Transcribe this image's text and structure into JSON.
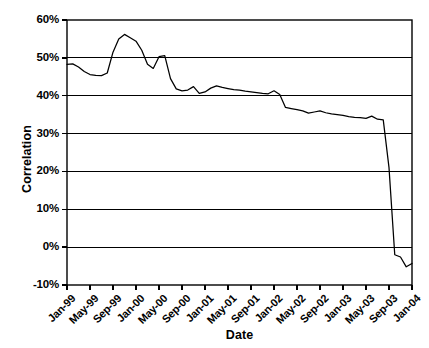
{
  "chart_data": {
    "type": "line",
    "title": "",
    "xlabel": "Date",
    "ylabel": "Correlation",
    "ylim": [
      -10,
      60
    ],
    "ytick_labels": [
      "60%",
      "50%",
      "40%",
      "30%",
      "20%",
      "10%",
      "0%",
      "-10%"
    ],
    "ytick_values": [
      60,
      50,
      40,
      30,
      20,
      10,
      0,
      -10
    ],
    "grid": true,
    "grid_axis": "y",
    "legend": "none",
    "xtick_labels": [
      "Jan-99",
      "May-99",
      "Sep-99",
      "Jan-00",
      "May-00",
      "Sep-00",
      "Jan-01",
      "May-01",
      "Sep-01",
      "Jan-02",
      "May-02",
      "Sep-02",
      "Jan-03",
      "May-03",
      "Sep-03",
      "Jan-04"
    ],
    "x_range_months": [
      "Jan-99",
      "Jan-04"
    ],
    "series": [
      {
        "name": "Correlation",
        "color": "#000000",
        "x": [
          "Jan-99",
          "Feb-99",
          "Mar-99",
          "Apr-99",
          "May-99",
          "Jun-99",
          "Jul-99",
          "Aug-99",
          "Sep-99",
          "Oct-99",
          "Nov-99",
          "Dec-99",
          "Jan-00",
          "Feb-00",
          "Mar-00",
          "Apr-00",
          "May-00",
          "Jun-00",
          "Jul-00",
          "Aug-00",
          "Sep-00",
          "Oct-00",
          "Nov-00",
          "Dec-00",
          "Jan-01",
          "Feb-01",
          "Mar-01",
          "Apr-01",
          "May-01",
          "Jun-01",
          "Jul-01",
          "Aug-01",
          "Sep-01",
          "Oct-01",
          "Nov-01",
          "Dec-01",
          "Jan-02",
          "Feb-02",
          "Mar-02",
          "Apr-02",
          "May-02",
          "Jun-02",
          "Jul-02",
          "Aug-02",
          "Sep-02",
          "Oct-02",
          "Nov-02",
          "Dec-02",
          "Jan-03",
          "Feb-03",
          "Mar-03",
          "Apr-03",
          "May-03",
          "Jun-03",
          "Jul-03",
          "Aug-03",
          "Sep-03",
          "Oct-03",
          "Nov-03",
          "Dec-03",
          "Jan-04"
        ],
        "values": [
          48.3,
          48.4,
          47.6,
          46.4,
          45.6,
          45.4,
          45.3,
          46.0,
          51.5,
          55.0,
          56.2,
          55.3,
          54.4,
          52.0,
          48.3,
          47.2,
          50.3,
          50.6,
          44.5,
          41.8,
          41.3,
          41.5,
          42.4,
          40.6,
          41.0,
          42.0,
          42.6,
          42.2,
          41.9,
          41.6,
          41.5,
          41.2,
          41.0,
          40.8,
          40.6,
          40.5,
          41.3,
          40.3,
          36.9,
          36.6,
          36.3,
          36.0,
          35.4,
          35.7,
          36.0,
          35.5,
          35.2,
          35.0,
          34.8,
          34.5,
          34.3,
          34.2,
          34.0,
          34.6,
          33.8,
          33.6,
          21.0,
          -2.0,
          -2.6,
          -5.2,
          -4.3
        ]
      }
    ]
  },
  "axes": {
    "y_title": "Correlation",
    "x_title": "Date"
  }
}
